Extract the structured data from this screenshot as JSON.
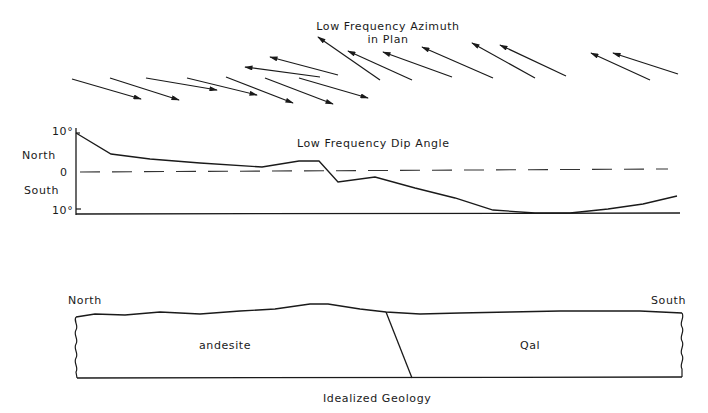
{
  "azimuth_panel": {
    "title_line1": "Low Frequency Azimuth",
    "title_line2": "in Plan",
    "arrows": [
      {
        "x1": 72,
        "y1": 79,
        "x2": 141,
        "y2": 99,
        "direction": "south"
      },
      {
        "x1": 110,
        "y1": 78,
        "x2": 179,
        "y2": 100,
        "direction": "south"
      },
      {
        "x1": 146,
        "y1": 78,
        "x2": 217,
        "y2": 90,
        "direction": "south"
      },
      {
        "x1": 187,
        "y1": 78,
        "x2": 257,
        "y2": 95,
        "direction": "south"
      },
      {
        "x1": 226,
        "y1": 77,
        "x2": 293,
        "y2": 103,
        "direction": "south"
      },
      {
        "x1": 265,
        "y1": 78,
        "x2": 333,
        "y2": 104,
        "direction": "south"
      },
      {
        "x1": 299,
        "y1": 78,
        "x2": 368,
        "y2": 98,
        "direction": "south"
      },
      {
        "x1": 338,
        "y1": 75,
        "x2": 270,
        "y2": 57,
        "direction": "north"
      },
      {
        "x1": 320,
        "y1": 77,
        "x2": 245,
        "y2": 67,
        "direction": "north"
      },
      {
        "x1": 380,
        "y1": 80,
        "x2": 318,
        "y2": 37,
        "direction": "north"
      },
      {
        "x1": 412,
        "y1": 80,
        "x2": 348,
        "y2": 51,
        "direction": "north"
      },
      {
        "x1": 452,
        "y1": 77,
        "x2": 383,
        "y2": 52,
        "direction": "north"
      },
      {
        "x1": 493,
        "y1": 78,
        "x2": 422,
        "y2": 47,
        "direction": "north"
      },
      {
        "x1": 535,
        "y1": 78,
        "x2": 472,
        "y2": 43,
        "direction": "north"
      },
      {
        "x1": 566,
        "y1": 76,
        "x2": 500,
        "y2": 45,
        "direction": "north"
      },
      {
        "x1": 650,
        "y1": 80,
        "x2": 591,
        "y2": 53,
        "direction": "north"
      },
      {
        "x1": 678,
        "y1": 74,
        "x2": 613,
        "y2": 53,
        "direction": "north"
      }
    ]
  },
  "dip_panel": {
    "title": "Low Frequency Dip Angle",
    "y_axis": {
      "top_tick": "10°",
      "north_label": "North",
      "zero_tick": "0",
      "south_label": "South",
      "bottom_tick": "10°"
    },
    "profile_points": [
      [
        76,
        133
      ],
      [
        111,
        154
      ],
      [
        150,
        159
      ],
      [
        200,
        163
      ],
      [
        262,
        167
      ],
      [
        299,
        161
      ],
      [
        319,
        161
      ],
      [
        338,
        182
      ],
      [
        375,
        177
      ],
      [
        415,
        188
      ],
      [
        455,
        198
      ],
      [
        493,
        210
      ],
      [
        535,
        213
      ],
      [
        570,
        213
      ],
      [
        608,
        209
      ],
      [
        643,
        204
      ],
      [
        677,
        196
      ]
    ],
    "zero_line_y": 172,
    "baseline_y": 214,
    "axis_x": 76
  },
  "geology_panel": {
    "north_label": "North",
    "south_label": "South",
    "left_unit": "andesite",
    "right_unit": "Qal",
    "caption": "Idealized Geology",
    "surface_points": [
      [
        76,
        317
      ],
      [
        95,
        314
      ],
      [
        125,
        315
      ],
      [
        160,
        312
      ],
      [
        200,
        314
      ],
      [
        240,
        311
      ],
      [
        275,
        309
      ],
      [
        310,
        304
      ],
      [
        328,
        304
      ],
      [
        360,
        309
      ],
      [
        386,
        312
      ],
      [
        420,
        314
      ],
      [
        460,
        313
      ],
      [
        510,
        312
      ],
      [
        560,
        311
      ],
      [
        640,
        311
      ],
      [
        682,
        313
      ]
    ],
    "fault": {
      "x1": 386,
      "y1": 312,
      "x2": 412,
      "y2": 378
    },
    "bottom_y": 378,
    "left_x": 76,
    "right_x": 682
  },
  "colors": {
    "ink": "#1a1a1a",
    "dash": "#333333",
    "background": "#ffffff"
  }
}
